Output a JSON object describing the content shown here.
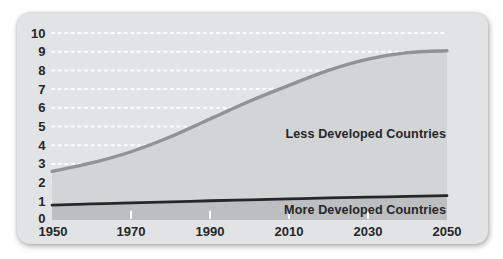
{
  "panel": {
    "background": "#e2e3e4",
    "grid_color": "#ffffff",
    "text_color": "#25272b"
  },
  "chart_data": {
    "type": "area",
    "title": "",
    "xlabel": "",
    "ylabel": "",
    "x": [
      1950,
      1960,
      1970,
      1980,
      1990,
      2000,
      2010,
      2020,
      2030,
      2040,
      2050
    ],
    "series": [
      {
        "name": "Less Developed Countries",
        "stroke": "#909294",
        "fill": "#d3d4d6",
        "values": [
          2.6,
          3.05,
          3.65,
          4.45,
          5.4,
          6.35,
          7.2,
          8.0,
          8.6,
          8.95,
          9.05
        ]
      },
      {
        "name": "More Developed Countries",
        "stroke": "#25272c",
        "fill": "#bdbec0",
        "values": [
          0.8,
          0.86,
          0.92,
          0.97,
          1.03,
          1.08,
          1.13,
          1.18,
          1.22,
          1.26,
          1.3
        ]
      }
    ],
    "x_ticks": [
      "1950",
      "1970",
      "1990",
      "2010",
      "2030",
      "2050"
    ],
    "y_ticks": [
      "0",
      "1",
      "2",
      "3",
      "4",
      "5",
      "6",
      "7",
      "8",
      "9",
      "10"
    ],
    "xlim": [
      1950,
      2050
    ],
    "ylim": [
      0,
      10
    ],
    "grid": "horizontal white dotted lines at each integer value",
    "legend_position": "labels inline on chart areas"
  }
}
